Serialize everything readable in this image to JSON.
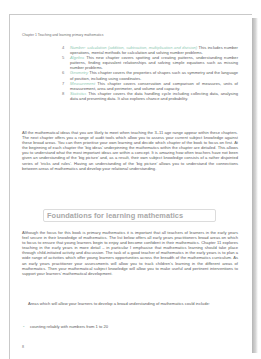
{
  "running_head": "Chapter 1 Teaching and learning primary mathematics",
  "chapter_list": [
    {
      "number": "4",
      "label": "Number: calculation (addition, subtraction, multiplication and division)",
      "text": " This includes number operations, mental methods for calculation and solving number problems."
    },
    {
      "number": "5",
      "label": "Algebra",
      "text": " This new chapter covers spotting and creating patterns, understanding number patterns, finding equivalent relationships and solving simple equations such as missing number problems."
    },
    {
      "number": "6",
      "label": "Geometry",
      "text": " This chapter covers the properties of shapes such as symmetry and the language of position, including using coordinates."
    },
    {
      "number": "7",
      "label": "Measurement",
      "text": " This chapter covers conservation and comparison of measures, units of measurement, area and perimeter, and volume and capacity."
    },
    {
      "number": "8",
      "label": "Statistics",
      "text": " This chapter covers the data handling cycle including collecting data, analysing data and presenting data. It also explores chance and probability."
    }
  ],
  "paragraph_1": "All the mathematical ideas that you are likely to meet when teaching the 3–11 age range appear within these chapters. The next chapter offers you a range of audit tools which allow you to assess your current subject knowledge against these broad areas. You can then prioritise your own learning and decide which chapter of the book to focus on first. At the beginning of each chapter the ‘big ideas’ underpinning the mathematics within the chapter are detailed. This allows you to understand what the most important ideas are within a concept. It is amazing how often teachers have not been given an understanding of the ‘big picture’ and, as a result, their own subject knowledge consists of a rather disjointed series of ‘tricks and rules’. Having an understanding of the ‘big picture’ allows you to understand the connections between areas of mathematics and develop your relational understanding.",
  "section_heading": "Foundations for learning mathematics",
  "paragraph_2": "Although the focus for this book is primary mathematics it is important that all teachers of learners in the early years feel secure in their knowledge of mathematics. The list below offers all early years practitioners broad areas on which to focus to ensure that young learners begin to enjoy and become confident in their mathematics. Chapter 11 explores teaching in the early years in more detail – in particular I emphasise that mathematics learning should take place through child-initiated activity and discussion. The task of a good teacher of mathematics in the early years is to plan a wide range of activities which offer young learners opportunities across the breadth of the mathematics curriculum. As an early years practitioner your assessments will allow you to track children’s learning in the different areas of mathematics. Then your mathematical subject knowledge will allow you to make useful and pertinent interventions to support your learners’ mathematical development.",
  "paragraph_3": "Areas which will allow your learners to develop a broad understanding of mathematics could include:",
  "bullets": [
    "counting reliably with numbers from 1 to 20"
  ],
  "bullet_symbol": "•",
  "page_number": "8",
  "colors": {
    "label_accent": "#8fc9b3",
    "body_text": "#5a5a5a",
    "heading_text": "#a9a9a9"
  }
}
